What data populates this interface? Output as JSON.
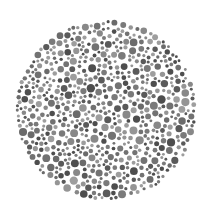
{
  "plate": {
    "type": "ishihara-style dot plate (grayscale)",
    "center": [
      106,
      110
    ],
    "radius": 91,
    "background": "#ffffff",
    "dot_colors": [
      "#5a5a5a",
      "#6b6b6b",
      "#7a7a7a",
      "#888888",
      "#959595",
      "#4e4e4e",
      "#9e9e9e",
      "#727272"
    ],
    "min_dot_radius": 1.4,
    "max_dot_radius": 4.2,
    "hidden_figure": ""
  }
}
